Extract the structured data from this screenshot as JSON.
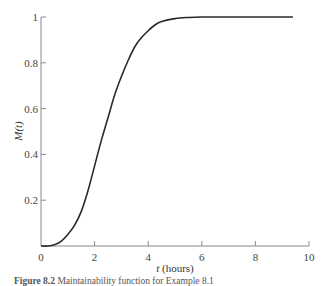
{
  "chart_data": {
    "type": "line",
    "title": "",
    "xlabel": "t (hours)",
    "ylabel": "M(t)",
    "xlim": [
      0,
      10
    ],
    "ylim": [
      0,
      1
    ],
    "grid": false,
    "legend": null,
    "x_ticks": [
      0,
      2,
      4,
      6,
      8,
      10
    ],
    "x_tick_labels": [
      "0",
      "2",
      "4",
      "6",
      "8",
      "10"
    ],
    "y_ticks": [
      0.2,
      0.4,
      0.6,
      0.8,
      1
    ],
    "y_tick_labels": [
      "0.2",
      "0.4",
      "0.6",
      "0.8",
      "1"
    ],
    "series": [
      {
        "name": "M(t)",
        "x": [
          0,
          0.25,
          0.5,
          0.75,
          1,
          1.25,
          1.5,
          1.75,
          2,
          2.25,
          2.5,
          2.75,
          3,
          3.25,
          3.5,
          3.75,
          4,
          4.25,
          4.5,
          5,
          5.5,
          6,
          7,
          8,
          9,
          9.4
        ],
        "values": [
          0,
          0.0,
          0.005,
          0.02,
          0.05,
          0.09,
          0.15,
          0.24,
          0.35,
          0.46,
          0.56,
          0.66,
          0.74,
          0.81,
          0.87,
          0.91,
          0.94,
          0.965,
          0.98,
          0.993,
          0.998,
          1.0,
          1.0,
          1.0,
          1.0,
          1.0
        ]
      }
    ]
  },
  "caption": {
    "label": "Figure 8.2",
    "text": "Maintainability function for Example 8.1"
  },
  "colors": {
    "curve": "#2a2a2a",
    "axis": "#8a8a8a"
  }
}
